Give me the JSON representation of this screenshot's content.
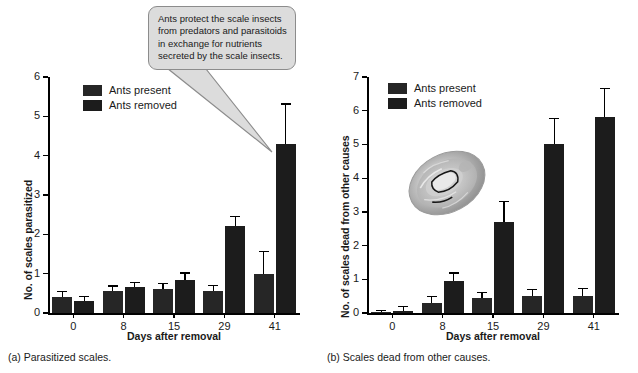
{
  "figure": {
    "panel_a_caption": "(a) Parasitized scales.",
    "panel_b_caption": "(b) Scales dead from other causes."
  },
  "callout": {
    "text": "Ants protect the scale insects from predators and parasitoids in exchange for nutrients secreted by the scale insects.",
    "line1": "Ants protect the scale insects",
    "line2": "from predators and parasitoids",
    "line3": "in exchange for nutrients",
    "line4": "secreted by the scale insects.",
    "fill_color": "#dcdcdc",
    "border_color": "#8c8c8c"
  },
  "legend": {
    "present_label": "Ants present",
    "removed_label": "Ants removed",
    "present_color": "#262626",
    "removed_color": "#1c1c1c"
  },
  "photo": {
    "name": "scale-insect-photo",
    "alt": "Scale insect"
  },
  "chart_data": [
    {
      "id": "panel-a",
      "type": "bar",
      "title": "",
      "xlabel": "Days after removal",
      "ylabel": "No. of scales parasitized",
      "categories": [
        "0",
        "8",
        "15",
        "29",
        "41"
      ],
      "ylim": [
        0,
        6
      ],
      "yticks": [
        0,
        1,
        2,
        3,
        4,
        5,
        6
      ],
      "grid": false,
      "legend_position": "top-left",
      "series": [
        {
          "name": "Ants present",
          "color": "#262626",
          "values": [
            0.4,
            0.55,
            0.6,
            0.55,
            1.0
          ],
          "errors": [
            0.13,
            0.12,
            0.13,
            0.13,
            0.55
          ]
        },
        {
          "name": "Ants removed",
          "color": "#1c1c1c",
          "values": [
            0.3,
            0.65,
            0.85,
            2.2,
            4.3
          ],
          "errors": [
            0.1,
            0.12,
            0.15,
            0.23,
            1.0
          ]
        }
      ]
    },
    {
      "id": "panel-b",
      "type": "bar",
      "title": "",
      "xlabel": "Days after removal",
      "ylabel": "No. of scales dead from other causes",
      "categories": [
        "0",
        "8",
        "15",
        "29",
        "41"
      ],
      "ylim": [
        0,
        7
      ],
      "yticks": [
        0,
        1,
        2,
        3,
        4,
        5,
        6,
        7
      ],
      "grid": false,
      "legend_position": "top-left",
      "series": [
        {
          "name": "Ants present",
          "color": "#262626",
          "values": [
            0.03,
            0.3,
            0.45,
            0.5,
            0.5
          ],
          "errors": [
            0.02,
            0.17,
            0.13,
            0.18,
            0.2
          ]
        },
        {
          "name": "Ants removed",
          "color": "#1c1c1c",
          "values": [
            0.07,
            0.95,
            2.7,
            5.0,
            5.8
          ],
          "errors": [
            0.1,
            0.22,
            0.6,
            0.75,
            0.85
          ]
        }
      ]
    }
  ]
}
